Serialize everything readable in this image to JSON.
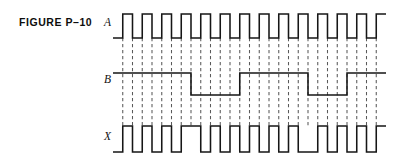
{
  "figure": {
    "caption": "FIGURE P–10",
    "type": "digital-timing-diagram",
    "background_color": "#ffffff",
    "trace_color": "#161616",
    "grid_color": "#5a5a5a"
  },
  "signals": [
    {
      "name": "A",
      "label": "A",
      "row_index": 0
    },
    {
      "name": "B",
      "label": "B",
      "row_index": 1
    },
    {
      "name": "X",
      "label": "X",
      "row_index": 2
    }
  ],
  "chart_data": {
    "type": "line",
    "title": "FIGURE P–10",
    "xlabel": "",
    "ylabel": "",
    "grid": true,
    "legend_position": "left-axis-labels",
    "timebase": {
      "clock_period_units": 2,
      "total_units": 28,
      "x_start_px": 113,
      "x_end_px": 396,
      "unit_width_px": 9.75
    },
    "levels": {
      "A": {
        "low_px": 38,
        "high_px": 14
      },
      "B": {
        "low_px": 95,
        "high_px": 73
      },
      "X": {
        "low_px": 152,
        "high_px": 126
      }
    },
    "series": [
      {
        "name": "A",
        "initial_level": 0,
        "transitions_units": [
          1,
          2,
          3,
          4,
          5,
          6,
          7,
          8,
          9,
          10,
          11,
          12,
          13,
          14,
          15,
          16,
          17,
          18,
          19,
          20,
          21,
          22,
          23,
          24,
          25,
          26,
          27
        ],
        "description": "Square-wave clock, 50% duty cycle, 14 HIGH pulses"
      },
      {
        "name": "B",
        "initial_level": 1,
        "transitions_units": [
          8,
          13,
          20,
          24
        ],
        "description": "HIGH 0-8, LOW 8-13, HIGH 13-20, LOW 20-24, HIGH 24-28"
      },
      {
        "name": "X",
        "initial_level": 0,
        "transitions_units": [
          1,
          2,
          3,
          4,
          5,
          6,
          7,
          9,
          10,
          11,
          12,
          13,
          14,
          15,
          16,
          17,
          18,
          19,
          21,
          22,
          23,
          24,
          25,
          26,
          27
        ],
        "description": "XNOR of A and B"
      }
    ],
    "grid_lines_units": [
      1,
      2,
      3,
      4,
      5,
      6,
      7,
      8,
      9,
      10,
      11,
      12,
      13,
      14,
      15,
      16,
      17,
      18,
      19,
      20,
      21,
      22,
      23,
      24,
      25,
      26,
      27
    ]
  }
}
